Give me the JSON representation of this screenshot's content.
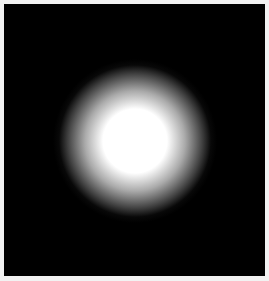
{
  "image": {
    "description": "Soft white radial glow centered on a black square background",
    "background_color": "#000000",
    "frame_color": "#f2f2f2",
    "glow": {
      "center_x": 131,
      "center_y": 137,
      "core_radius": 32,
      "outer_radius": 82,
      "core_color": "#ffffff"
    }
  }
}
